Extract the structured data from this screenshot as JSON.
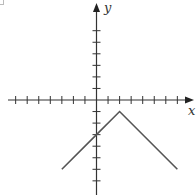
{
  "chart_data": {
    "type": "line",
    "title": "",
    "xlabel": "x",
    "ylabel": "y",
    "function": "y = -|x - 2| - 1",
    "xlim": [
      -7.5,
      8.2
    ],
    "ylim": [
      -7.5,
      8.2
    ],
    "grid": false,
    "legend": null,
    "x_ticks": [
      -7,
      -6,
      -5,
      -4,
      -3,
      -2,
      -1,
      1,
      2,
      3,
      4,
      5,
      6,
      7
    ],
    "y_ticks": [
      -7,
      -6,
      -5,
      -4,
      -3,
      -2,
      -1,
      1,
      2,
      3,
      4,
      5,
      6
    ],
    "tick_labels_shown": false,
    "series": [
      {
        "name": "graph",
        "color": "#555555",
        "points": [
          [
            -3,
            -6
          ],
          [
            0,
            -3
          ],
          [
            2,
            -1
          ],
          [
            7,
            -6
          ]
        ]
      }
    ],
    "annotations": {
      "vertex": [
        2,
        -1
      ],
      "y_intercept": [
        0,
        -3
      ]
    }
  },
  "axes": {
    "x_label": "x",
    "y_label": "y",
    "color": "#333333"
  }
}
